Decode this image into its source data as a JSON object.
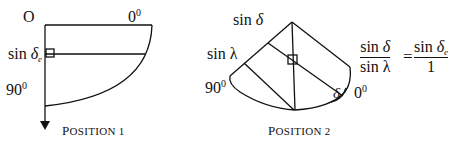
{
  "position1": {
    "origin_label": "O",
    "zero_label": "0",
    "zero_sup": "0",
    "sin_label": "sin ",
    "delta_e": "δ",
    "delta_e_sub": "e",
    "ninety_label": "90",
    "ninety_sup": "0",
    "caption_first": "P",
    "caption_rest": "OSITION 1"
  },
  "position2": {
    "sin_delta_prefix": "sin ",
    "sin_delta_sym": "δ",
    "sin_lambda": "sin λ",
    "ninety_label": "90",
    "ninety_sup": "0",
    "delta_angle": "δ",
    "zero_label": "0",
    "zero_sup": "0",
    "caption_first": "P",
    "caption_rest": "OSITION 2"
  },
  "equation": {
    "lhs_num_prefix": "sin ",
    "lhs_num_sym": "δ",
    "lhs_den": "sin λ",
    "equals": "=",
    "rhs_num_prefix": "sin ",
    "rhs_num_sym": "δ",
    "rhs_num_sub": "e",
    "rhs_den": "1"
  }
}
